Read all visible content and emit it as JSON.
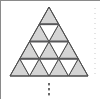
{
  "figure": {
    "name": "triangular-lattice-subdivision",
    "caption": "",
    "background_color": "#ffffff",
    "frame": {
      "top_border_color": "#8a8a8a",
      "left_border_color": "#8a8a8a",
      "top_border_width": 1,
      "left_border_width": 1,
      "show_top": true,
      "show_left": true,
      "show_right": false,
      "show_bottom": false
    },
    "outer_triangle": {
      "apex": [
        49,
        7
      ],
      "base_left": [
        10,
        76
      ],
      "base_right": [
        88,
        76
      ],
      "stroke_color": "#4d4d4d",
      "stroke_width": 1
    },
    "rows": 4,
    "upward_triangle_fill": "#d4d4d4",
    "downward_triangle_fill": "#ffffff",
    "grid_stroke_color": "#4d4d4d",
    "grid_stroke_width": 1,
    "emphasis_bars": {
      "color": "#58585a",
      "width": 1.8,
      "levels": [
        1,
        2,
        3
      ],
      "note": "darker horizontal rules at each interior row boundary"
    },
    "ellipsis": {
      "symbol": "vertical-ellipsis",
      "glyph": "⋮",
      "dot_color": "#6b6b6b",
      "dot_count": 3,
      "x": 49,
      "y_start": 83,
      "y_step": 5,
      "dot_width": 2,
      "dot_height": 2.4
    },
    "right_dotted_guide": {
      "visible": true,
      "x": 95,
      "y_start": 8,
      "y_end": 74,
      "color": "#c9c9c9",
      "dash": "1 4",
      "width": 1
    }
  },
  "labels": {
    "alt_text": "A large equilateral triangle subdivided into four rows of smaller equilateral triangles; upward-pointing triangles are shaded gray and downward-pointing triangles are white, with a vertical ellipsis below indicating continuation."
  }
}
